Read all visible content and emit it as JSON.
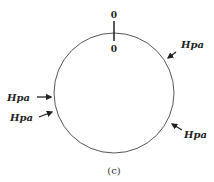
{
  "diagram": {
    "top_label_outer": "0",
    "top_label_inner": "0",
    "labels": {
      "upper_right": "Hpa",
      "left": "Hpa",
      "lower_left": "Hpa",
      "lower_right": "Hpa"
    },
    "caption": "(c)"
  }
}
